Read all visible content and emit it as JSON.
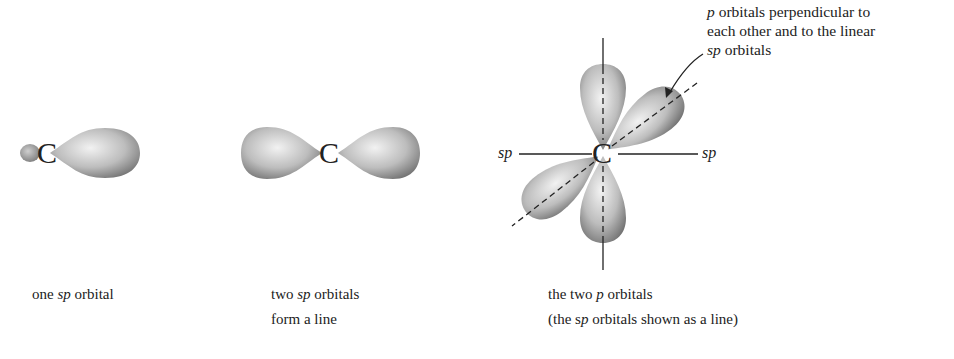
{
  "diagrams": [
    {
      "id": "one-sp",
      "atom": "C",
      "caption": {
        "pre": "one ",
        "em": "sp",
        "post": " orbital"
      }
    },
    {
      "id": "two-sp",
      "atom": "C",
      "caption": {
        "line1_pre": "two ",
        "line1_em": "sp",
        "line1_post": " orbitals",
        "line2": "form a line"
      }
    },
    {
      "id": "two-p",
      "atom": "C",
      "axis_labels": {
        "left": "sp",
        "right": "sp"
      },
      "caption": {
        "line1_pre": "the two ",
        "line1_em": "p",
        "line1_post": " orbitals",
        "line2_pre": "(the s",
        "line2_em": "p",
        "line2_post": " orbitals shown as a line)"
      }
    }
  ],
  "callout": {
    "line1_em": "p",
    "line1_post": " orbitals perpendicular to",
    "line2": "each other and to the linear",
    "line3_em": "sp",
    "line3_post": " orbitals"
  },
  "colors": {
    "lobe_light": "#f0f0f0",
    "lobe_dark": "#6e6e6e",
    "line": "#222222"
  }
}
